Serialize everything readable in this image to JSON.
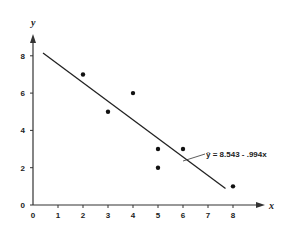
{
  "chart_data": {
    "type": "scatter",
    "title": "",
    "xlabel": "x",
    "ylabel": "y",
    "xlim": [
      0,
      9
    ],
    "ylim": [
      0,
      9
    ],
    "x_ticks": [
      0,
      1,
      2,
      3,
      4,
      5,
      6,
      7,
      8
    ],
    "y_ticks": [
      0,
      2,
      4,
      6,
      8
    ],
    "grid": false,
    "series": [
      {
        "name": "observations",
        "type": "scatter",
        "points": [
          {
            "x": 2,
            "y": 7
          },
          {
            "x": 3,
            "y": 5
          },
          {
            "x": 4,
            "y": 6
          },
          {
            "x": 5,
            "y": 3
          },
          {
            "x": 5,
            "y": 2
          },
          {
            "x": 6,
            "y": 3
          },
          {
            "x": 8,
            "y": 1
          }
        ]
      },
      {
        "name": "regression line",
        "type": "line",
        "intercept": 8.543,
        "slope": -0.994,
        "x_range": [
          0.4,
          7.7
        ]
      }
    ],
    "annotations": [
      {
        "text": "ŷ = 8.543 - .994x",
        "points_to": {
          "x": 6,
          "y": 2.6
        }
      }
    ]
  },
  "labels": {
    "x_axis": "x",
    "y_axis": "y",
    "equation": "ŷ = 8.543 - .994x",
    "x_ticks": [
      "0",
      "1",
      "2",
      "3",
      "4",
      "5",
      "6",
      "7",
      "8"
    ],
    "y_ticks": [
      "0",
      "2",
      "4",
      "6",
      "8"
    ]
  }
}
